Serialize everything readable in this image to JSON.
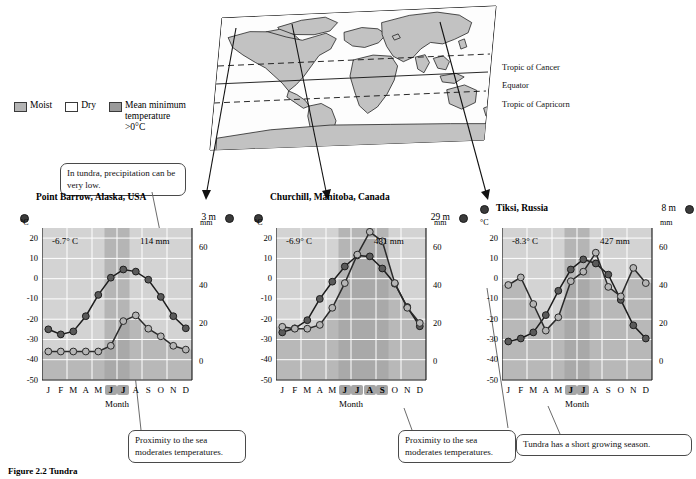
{
  "figure": {
    "caption": "Figure 2.2  Tundra"
  },
  "map": {
    "labels": [
      {
        "name": "tropic-of-cancer",
        "text": "Tropic of Cancer"
      },
      {
        "name": "equator",
        "text": "Equator"
      },
      {
        "name": "tropic-of-capricorn",
        "text": "Tropic of Capricorn"
      }
    ]
  },
  "legend": {
    "items": [
      {
        "name": "moist",
        "label": "Moist",
        "color": "#b4b4b4"
      },
      {
        "name": "dry",
        "label": "Dry",
        "color": "#ffffff"
      },
      {
        "name": "mean-minimum",
        "label": "Mean minimum temperature >0°C",
        "color": "#9a9a9a"
      }
    ]
  },
  "callouts": [
    {
      "name": "callout-precipitation-low",
      "text": "In tundra, precipitation can be very low."
    },
    {
      "name": "callout-sea-moderates-1",
      "text": "Proximity to the sea moderates temperatures."
    },
    {
      "name": "callout-sea-moderates-2",
      "text": "Proximity to the sea moderates temperatures."
    },
    {
      "name": "callout-short-growing-season",
      "text": "Tundra has a short growing season."
    }
  ],
  "axis": {
    "temp_unit": "°C",
    "precip_unit": "mm",
    "x_label": "Month",
    "temp_ticks": [
      "20",
      "10",
      "0",
      "-10",
      "-20",
      "-30",
      "-40",
      "-50"
    ],
    "precip_ticks": [
      "60",
      "40",
      "20",
      "0"
    ],
    "months": [
      "J",
      "F",
      "M",
      "A",
      "M",
      "J",
      "J",
      "A",
      "S",
      "O",
      "N",
      "D"
    ]
  },
  "chart_data": [
    {
      "type": "line",
      "name": "point-barrow",
      "title": "Point Barrow, Alaska, USA",
      "elevation": "3 m",
      "mean_temp_label": "-6.7° C",
      "annual_precip_label": "114 mm",
      "xlabel": "Month",
      "ylabel": "°C",
      "y2label": "mm",
      "categories": [
        "J",
        "F",
        "M",
        "A",
        "M",
        "J",
        "J",
        "A",
        "S",
        "O",
        "N",
        "D"
      ],
      "ylim": [
        -50,
        25
      ],
      "y2lim": [
        -10,
        70
      ],
      "growing_season_months": [
        "J",
        "A"
      ],
      "series": [
        {
          "name": "Temperature (°C)",
          "values": [
            -25,
            -27.5,
            -26,
            -18.5,
            -8,
            0.5,
            4.5,
            3.5,
            -0.5,
            -9,
            -18.5,
            -24.5
          ]
        },
        {
          "name": "Precipitation (mm)",
          "values": [
            5,
            5,
            5,
            5,
            5,
            8,
            21,
            24,
            17,
            13,
            8,
            6
          ]
        }
      ]
    },
    {
      "type": "line",
      "name": "churchill",
      "title": "Churchill, Manitoba, Canada",
      "elevation": "29 m",
      "mean_temp_label": "-6.9° C",
      "annual_precip_label": "431 mm",
      "xlabel": "Month",
      "ylabel": "°C",
      "y2label": "mm",
      "categories": [
        "J",
        "F",
        "M",
        "A",
        "M",
        "J",
        "J",
        "A",
        "S",
        "O",
        "N",
        "D"
      ],
      "ylim": [
        -50,
        25
      ],
      "y2lim": [
        -10,
        70
      ],
      "growing_season_months": [
        "J",
        "J",
        "A",
        "S"
      ],
      "series": [
        {
          "name": "Temperature (°C)",
          "values": [
            -26.5,
            -24.5,
            -20.5,
            -10,
            -1.5,
            6,
            11.5,
            11,
            5,
            -2.5,
            -14,
            -23.5
          ]
        },
        {
          "name": "Precipitation (mm)",
          "values": [
            18,
            17,
            17,
            19,
            28,
            41,
            56,
            68,
            63,
            41,
            28,
            20
          ]
        }
      ]
    },
    {
      "type": "line",
      "name": "tiksi",
      "title": "Tiksi, Russia",
      "elevation": "8 m",
      "mean_temp_label": "-8.3° C",
      "annual_precip_label": "427 mm",
      "xlabel": "Month",
      "ylabel": "°C",
      "y2label": "mm",
      "categories": [
        "J",
        "F",
        "M",
        "A",
        "M",
        "J",
        "J",
        "A",
        "S",
        "O",
        "N",
        "D"
      ],
      "ylim": [
        -50,
        25
      ],
      "y2lim": [
        -10,
        70
      ],
      "growing_season_months": [
        "J",
        "A"
      ],
      "series": [
        {
          "name": "Temperature (°C)",
          "values": [
            -31,
            -29.5,
            -26.5,
            -18,
            -6,
            4.5,
            9.5,
            7.5,
            2,
            -10.5,
            -23,
            -29.5
          ]
        },
        {
          "name": "Precipitation (mm)",
          "values": [
            40,
            44,
            30,
            16,
            23,
            42,
            47,
            57,
            39,
            34,
            49,
            41
          ]
        }
      ]
    }
  ]
}
